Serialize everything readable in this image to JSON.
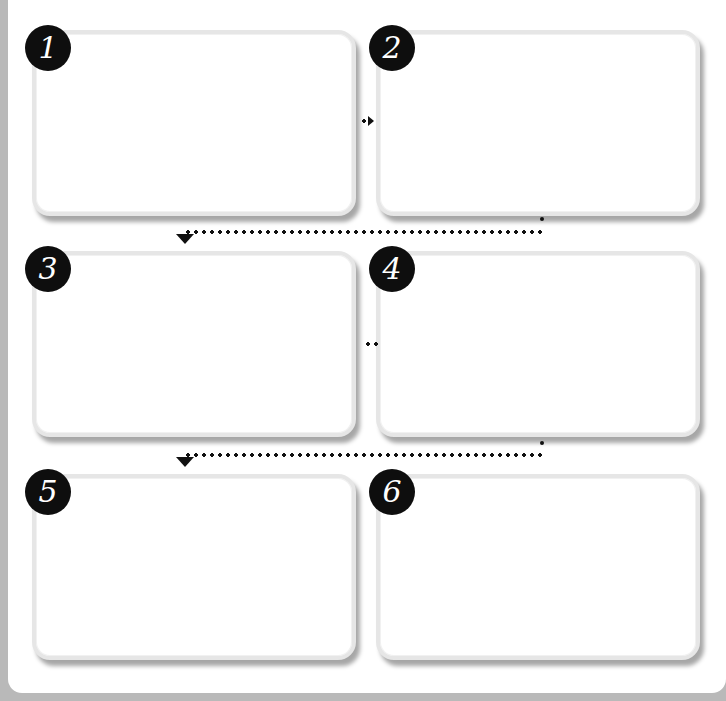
{
  "diagram": {
    "type": "storyboard-flow",
    "colors": {
      "background": "#b9b9b9",
      "sheet": "#ffffff",
      "panel_border": "#e6e6e6",
      "badge": "#0e0e0e",
      "badge_text": "#ffffff",
      "connector": "#111111"
    },
    "panels": [
      {
        "number": "1",
        "content": ""
      },
      {
        "number": "2",
        "content": ""
      },
      {
        "number": "3",
        "content": ""
      },
      {
        "number": "4",
        "content": ""
      },
      {
        "number": "5",
        "content": ""
      },
      {
        "number": "6",
        "content": ""
      }
    ],
    "connectors": [
      {
        "from": "1",
        "to": "2",
        "style": "dotted-arrow-right"
      },
      {
        "from": "2",
        "to": "3",
        "style": "dotted-arrow-down-left"
      },
      {
        "from": "3",
        "to": "4",
        "style": "dotted-short"
      },
      {
        "from": "4",
        "to": "5",
        "style": "dotted-arrow-down-left"
      }
    ]
  }
}
